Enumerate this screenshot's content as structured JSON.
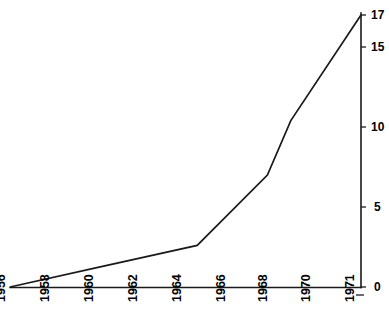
{
  "chart_data": {
    "type": "line",
    "title": "",
    "subtitle": "",
    "xlabel": "",
    "ylabel": "",
    "x": [
      1956,
      1960,
      1964,
      1967,
      1968,
      1971
    ],
    "values": [
      0,
      1.3,
      2.6,
      7,
      10.4,
      17
    ],
    "series": [
      {
        "name": "cumulative total",
        "x": [
          1956,
          1960,
          1964,
          1967,
          1968,
          1971
        ],
        "values": [
          0,
          1.3,
          2.6,
          7,
          10.4,
          17
        ]
      }
    ],
    "xlim": [
      1956,
      1971
    ],
    "ylim": [
      0,
      17
    ],
    "x_tick_labels": [
      "1956",
      "1958",
      "1960",
      "1962",
      "1964",
      "1966",
      "1968",
      "1970",
      "1971"
    ],
    "x_tick_values": [
      1956,
      1958,
      1960,
      1962,
      1964,
      1966,
      1968,
      1970,
      1971
    ],
    "y_tick_labels": [
      "0",
      "5",
      "10",
      "15",
      "17"
    ],
    "y_tick_values": [
      0,
      5,
      10,
      15,
      17
    ],
    "y_axis_position": "right",
    "grid": false,
    "legend": "none",
    "line_color": "#1a1a1a",
    "background_color": "#ffffff"
  },
  "axes": {
    "y_ticks": [
      {
        "label": "17",
        "value": 17
      },
      {
        "label": "15",
        "value": 15
      },
      {
        "label": "10",
        "value": 10
      },
      {
        "label": "5",
        "value": 5
      },
      {
        "label": "0",
        "value": 0
      }
    ],
    "x_ticks": [
      {
        "label": "1956",
        "value": 1956
      },
      {
        "label": "1958",
        "value": 1958
      },
      {
        "label": "1960",
        "value": 1960
      },
      {
        "label": "1962",
        "value": 1962
      },
      {
        "label": "1964",
        "value": 1964
      },
      {
        "label": "1966",
        "value": 1966
      },
      {
        "label": "1968",
        "value": 1968
      },
      {
        "label": "1970",
        "value": 1970
      },
      {
        "label": "1971",
        "value": 1971
      }
    ]
  }
}
